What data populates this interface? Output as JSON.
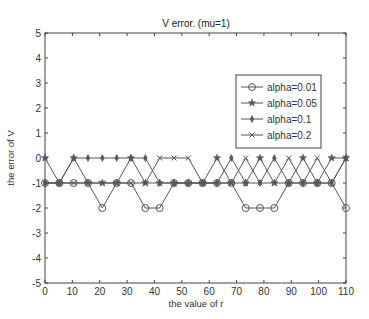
{
  "chart_data": {
    "type": "line",
    "title": "V error. (mu=1)",
    "xlabel": "the value of r",
    "ylabel": "the error of V",
    "xlim": [
      0,
      110
    ],
    "ylim": [
      -5,
      5
    ],
    "xticks": [
      0,
      10,
      20,
      30,
      40,
      50,
      60,
      70,
      80,
      90,
      100,
      110
    ],
    "yticks": [
      5,
      4,
      3,
      2,
      1,
      0,
      -1,
      -2,
      -3,
      -4,
      -5
    ],
    "grid": false,
    "legend_position": "upper right",
    "x": [
      0,
      5.24,
      10.48,
      15.71,
      20.95,
      26.19,
      31.43,
      36.67,
      41.9,
      47.14,
      52.38,
      57.62,
      62.86,
      68.1,
      73.33,
      78.57,
      83.81,
      89.05,
      94.29,
      99.52,
      104.76,
      110
    ],
    "series": [
      {
        "name": "alpha=0.01",
        "marker": "circle",
        "values": [
          -1,
          -1,
          -1,
          -1,
          -2,
          -1,
          -1,
          -2,
          -2,
          -1,
          -1,
          -1,
          -1,
          -1,
          -2,
          -2,
          -2,
          -1,
          -1,
          -1,
          -1,
          -2
        ]
      },
      {
        "name": "alpha=0.05",
        "marker": "star",
        "values": [
          0,
          -1,
          0,
          -1,
          -1,
          -1,
          0,
          -1,
          -1,
          -1,
          -1,
          -1,
          0,
          -1,
          -1,
          0,
          -1,
          -1,
          0,
          -1,
          0,
          0
        ]
      },
      {
        "name": "alpha=0.1",
        "marker": "diamond",
        "values": [
          -1,
          -1,
          0,
          0,
          0,
          0,
          0,
          0,
          -1,
          -1,
          -1,
          -1,
          -1,
          0,
          -1,
          -1,
          0,
          -1,
          -1,
          -1,
          -1,
          0
        ]
      },
      {
        "name": "alpha=0.2",
        "marker": "x",
        "values": [
          -1,
          -1,
          -1,
          -1,
          -1,
          -1,
          -1,
          -1,
          0,
          0,
          0,
          -1,
          -1,
          -1,
          0,
          -1,
          -1,
          0,
          -1,
          0,
          -1,
          0
        ]
      }
    ]
  },
  "colors": {
    "line": "#555555",
    "axis": "#444444",
    "background": "#ffffff"
  }
}
